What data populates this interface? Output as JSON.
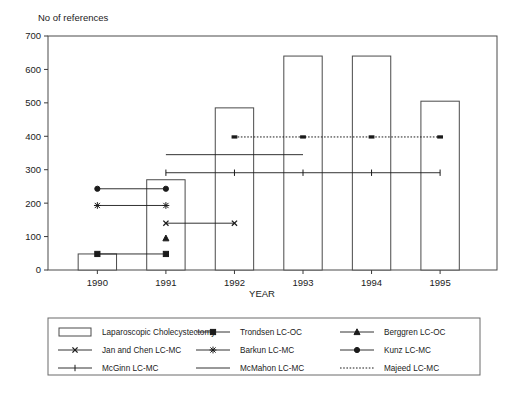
{
  "chart_data": {
    "type": "bar",
    "title": "",
    "ylabel": "No of references",
    "xlabel": "YEAR",
    "categories": [
      "1990",
      "1991",
      "1992",
      "1993",
      "1994",
      "1995"
    ],
    "ylim": [
      0,
      700
    ],
    "yticks": [
      "0",
      "100",
      "200",
      "300",
      "400",
      "500",
      "600",
      "700"
    ],
    "ytick_values": [
      0,
      100,
      200,
      300,
      400,
      500,
      600,
      700
    ],
    "grid": false,
    "legend_position": "below-plot",
    "series": [
      {
        "name": "Laparoscopic Cholecystectomy",
        "type": "bar",
        "marker": "open-rectangle",
        "values": [
          48,
          270,
          485,
          640,
          640,
          505
        ]
      },
      {
        "name": "Trondsen LC-OC",
        "type": "span-line",
        "marker": "filled-square",
        "level": 48,
        "start_year": "1990",
        "end_year": "1991"
      },
      {
        "name": "Berggren LC-OC",
        "type": "span-line",
        "marker": "filled-triangle",
        "level": 95,
        "start_year": "1991",
        "end_year": "1991"
      },
      {
        "name": "Jan and Chen LC-MC",
        "type": "span-line",
        "marker": "x-cross",
        "level": 140,
        "start_year": "1991",
        "end_year": "1992"
      },
      {
        "name": "Barkun LC-MC",
        "type": "span-line",
        "marker": "asterisk",
        "level": 193,
        "start_year": "1990",
        "end_year": "1991"
      },
      {
        "name": "Kunz LC-MC",
        "type": "span-line",
        "marker": "filled-circle",
        "level": 243,
        "start_year": "1990",
        "end_year": "1991"
      },
      {
        "name": "McGinn LC-MC",
        "type": "span-line",
        "marker": "vertical-tick",
        "level": 291,
        "start_year": "1991",
        "end_year": "1995"
      },
      {
        "name": "McMahon LC-MC",
        "type": "span-line",
        "marker": "plain-line",
        "level": 345,
        "start_year": "1991",
        "end_year": "1993"
      },
      {
        "name": "Majeed LC-MC",
        "type": "span-line",
        "marker": "dotted-line",
        "level": 398,
        "start_year": "1992",
        "end_year": "1995"
      }
    ]
  },
  "legend": {
    "rows": [
      [
        {
          "label": "Laparoscopic Cholecystectomy",
          "glyph": "open-rectangle"
        },
        {
          "label": "Trondsen LC-OC",
          "glyph": "filled-square"
        },
        {
          "label": "Berggren LC-OC",
          "glyph": "filled-triangle"
        }
      ],
      [
        {
          "label": "Jan and Chen LC-MC",
          "glyph": "x-cross"
        },
        {
          "label": "Barkun LC-MC",
          "glyph": "asterisk"
        },
        {
          "label": "Kunz LC-MC",
          "glyph": "filled-circle"
        }
      ],
      [
        {
          "label": "McGinn LC-MC",
          "glyph": "vertical-tick"
        },
        {
          "label": "McMahon LC-MC",
          "glyph": "plain-line"
        },
        {
          "label": "Majeed LC-MC",
          "glyph": "dotted-line"
        }
      ]
    ]
  },
  "colors": {
    "ink": "#1b1b1b",
    "axis": "#4a4a4a",
    "background": "#ffffff"
  }
}
